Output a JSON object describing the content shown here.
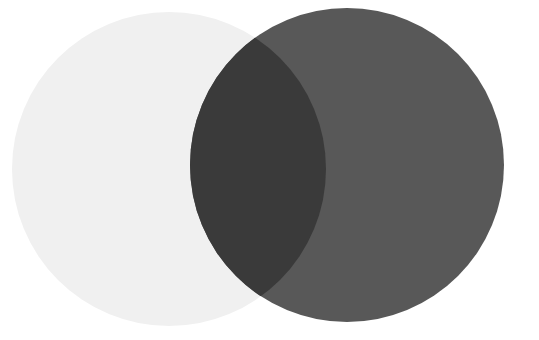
{
  "figure": {
    "type": "venn-diagram",
    "width": 539,
    "height": 340,
    "background_color": "#ffffff",
    "clipped_caption_text": "or different."
  },
  "colors": {
    "background": "#ffffff",
    "left_circle_fill": "#f0f0f0",
    "right_circle_fill": "#585858",
    "intersection_fill": "#3a3a3a",
    "caption_text": "#2b2b2b"
  },
  "chart_data": {
    "type": "venn",
    "title": "",
    "subtitle": "",
    "xlabel": "",
    "ylabel": "",
    "grid": false,
    "legend_position": "none",
    "sets": [
      {
        "name": "left-set",
        "label": "",
        "fill": "#f0f0f0",
        "center_x": 169,
        "center_y": 169,
        "radius": 157,
        "opacity": 1
      },
      {
        "name": "right-set",
        "label": "",
        "fill": "#585858",
        "center_x": 347,
        "center_y": 165,
        "radius": 157,
        "opacity": 1
      }
    ],
    "intersection": {
      "name": "overlap",
      "label": "",
      "fill": "#3a3a3a",
      "left_extent_x": 222,
      "right_extent_x": 318,
      "top_tip_x": 272,
      "top_tip_y": 48,
      "bottom_tip_x": 276,
      "bottom_tip_y": 288
    },
    "annotations": []
  }
}
